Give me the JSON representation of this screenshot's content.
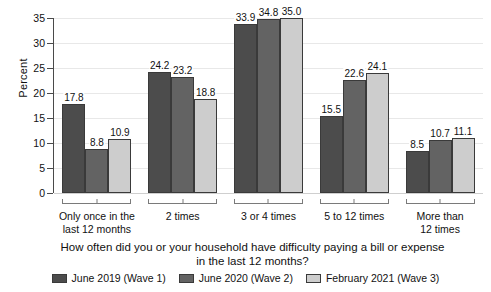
{
  "chart_data": {
    "type": "bar",
    "title": "",
    "xlabel": "How often did you or your household have difficulty paying a bill or expense in the last 12 months?",
    "ylabel": "Percent",
    "ylim": [
      0,
      35
    ],
    "yticks": [
      "0",
      "5",
      "10",
      "15",
      "20",
      "25",
      "30",
      "35"
    ],
    "grid": true,
    "legend_position": "bottom",
    "categories": [
      "Only once in the last 12 months",
      "2 times",
      "3 or 4 times",
      "5 to 12 times",
      "More than 12 times"
    ],
    "category_lines": [
      [
        "Only once in the",
        "last 12 months"
      ],
      [
        "2 times",
        ""
      ],
      [
        "3 or 4 times",
        ""
      ],
      [
        "5 to 12 times",
        ""
      ],
      [
        "More than",
        "12 times"
      ]
    ],
    "series": [
      {
        "name": "June 2019 (Wave 1)",
        "color": "#4c4c4c",
        "values": [
          17.8,
          24.2,
          33.9,
          15.5,
          8.5
        ],
        "labels": [
          "17.8",
          "24.2",
          "33.9",
          "15.5",
          "8.5"
        ]
      },
      {
        "name": "June 2020 (Wave 2)",
        "color": "#636363",
        "values": [
          8.8,
          23.2,
          34.8,
          22.6,
          10.7
        ],
        "labels": [
          "8.8",
          "23.2",
          "34.8",
          "22.6",
          "10.7"
        ]
      },
      {
        "name": "February 2021 (Wave 3)",
        "color": "#cdcdcd",
        "values": [
          10.9,
          18.8,
          35.0,
          24.1,
          11.1
        ],
        "labels": [
          "10.9",
          "18.8",
          "35.0",
          "24.1",
          "11.1"
        ]
      }
    ]
  }
}
